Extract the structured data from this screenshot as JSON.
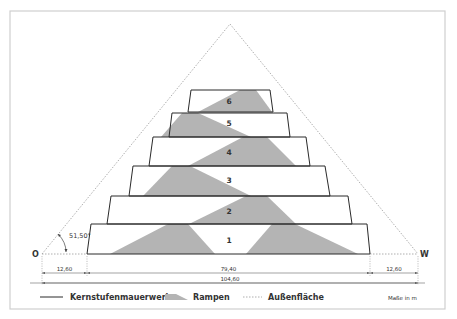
{
  "diagram": {
    "frame": {
      "x": 10,
      "y": 11,
      "w": 435,
      "h": 298,
      "stroke": "#cfcfcf"
    },
    "outer_triangle": {
      "apex": [
        230,
        24
      ],
      "left": [
        42,
        254
      ],
      "right": [
        418,
        254
      ],
      "stroke": "#9a9a9a"
    },
    "ramp_fill": "#b4b4b4",
    "core_stroke": "#2a2a2a",
    "steps": [
      {
        "label": "1",
        "top_y": 224,
        "bottom_y": 254,
        "top_left": 91,
        "top_right": 367,
        "bottom_left": 87,
        "bottom_right": 370,
        "label_pos": [
          229,
          243
        ]
      },
      {
        "label": "2",
        "top_y": 196,
        "bottom_y": 224,
        "top_left": 111,
        "top_right": 348,
        "bottom_left": 107,
        "bottom_right": 352,
        "label_pos": [
          229,
          214
        ]
      },
      {
        "label": "3",
        "top_y": 166,
        "bottom_y": 196,
        "top_left": 133,
        "top_right": 325,
        "bottom_left": 129,
        "bottom_right": 330,
        "label_pos": [
          229,
          183
        ]
      },
      {
        "label": "4",
        "top_y": 137,
        "bottom_y": 166,
        "top_left": 153,
        "top_right": 306,
        "bottom_left": 149,
        "bottom_right": 310,
        "label_pos": [
          229,
          155
        ]
      },
      {
        "label": "5",
        "top_y": 113,
        "bottom_y": 137,
        "top_left": 172,
        "top_right": 287,
        "bottom_left": 169,
        "bottom_right": 290,
        "label_pos": [
          229,
          126
        ]
      },
      {
        "label": "6",
        "top_y": 90,
        "bottom_y": 112,
        "top_left": 191,
        "top_right": 270,
        "bottom_left": 188,
        "bottom_right": 273,
        "label_pos": [
          229,
          104
        ]
      }
    ],
    "ramps": [
      {
        "points": "110,254 168,224 188,224 215,254"
      },
      {
        "points": "246,254 272,224 295,224 358,254"
      },
      {
        "points": "189,224 246,196 267,196 296,224"
      },
      {
        "points": "143,196 172,166 190,166 251,196"
      },
      {
        "points": "188,166 243,137 267,137 296,166"
      },
      {
        "points": "161,137 182,113 198,113 251,137"
      },
      {
        "points": "198,112 240,90 256,90 272,112"
      }
    ],
    "points": {
      "east_label": "O",
      "west_label": "W",
      "angle_label": "51,50°"
    },
    "dimensions": {
      "row1": [
        {
          "label": "12,60",
          "x1": 42,
          "x2": 87
        },
        {
          "label": "79,40",
          "x1": 87,
          "x2": 370
        },
        {
          "label": "12,60",
          "x1": 370,
          "x2": 418
        }
      ],
      "row2": [
        {
          "label": "104,60",
          "x1": 42,
          "x2": 418
        }
      ]
    }
  },
  "legend": {
    "items": [
      {
        "label": "Kernstufenmauerwerk",
        "type": "solid-line"
      },
      {
        "label": "Rampen",
        "type": "ramp-swatch"
      },
      {
        "label": "Außenfläche",
        "type": "dotted-line"
      }
    ],
    "units_note": "Maße in m"
  }
}
